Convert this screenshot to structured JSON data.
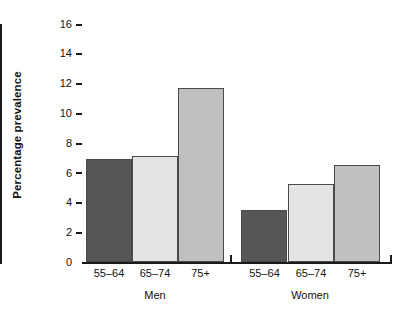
{
  "chart_data": {
    "type": "bar",
    "title": "",
    "xlabel": "",
    "ylabel": "Percentage prevalence",
    "ylim": [
      0,
      16
    ],
    "yticks": [
      0,
      2,
      4,
      6,
      8,
      10,
      12,
      14,
      16
    ],
    "ytick_labels": [
      "0",
      "2",
      "4",
      "6",
      "8",
      "10",
      "12",
      "14",
      "16"
    ],
    "grid": false,
    "legend": "none",
    "groups": [
      {
        "name": "Men",
        "categories": [
          "55–64",
          "65–74",
          "75+"
        ],
        "values": [
          6.9,
          7.1,
          11.7
        ],
        "colors": [
          "#565656",
          "#e4e4e4",
          "#c0c0c0"
        ]
      },
      {
        "name": "Women",
        "categories": [
          "55–64",
          "65–74",
          "75+"
        ],
        "values": [
          3.5,
          5.25,
          6.5
        ],
        "colors": [
          "#565656",
          "#e4e4e4",
          "#c0c0c0"
        ]
      }
    ],
    "categories": [
      "55–64",
      "65–74",
      "75+",
      "55–64",
      "65–74",
      "75+"
    ],
    "values": [
      6.9,
      7.1,
      11.7,
      3.5,
      5.25,
      6.5
    ],
    "colors": {
      "dark_gray": "#565656",
      "light_gray": "#e4e4e4",
      "medium_gray": "#c0c0c0",
      "axis": "#1a1a1a",
      "background": "#ffffff"
    }
  },
  "axis": {
    "y_title": "Percentage prevalence"
  },
  "ticks": {
    "t0": "0",
    "t1": "2",
    "t2": "4",
    "t3": "6",
    "t4": "8",
    "t5": "10",
    "t6": "12",
    "t7": "14",
    "t8": "16"
  },
  "labels": {
    "men_55_64": "55–64",
    "men_65_74": "65–74",
    "men_75plus": "75+",
    "women_55_64": "55–64",
    "women_65_74": "65–74",
    "women_75plus": "75+",
    "group_men": "Men",
    "group_women": "Women"
  }
}
